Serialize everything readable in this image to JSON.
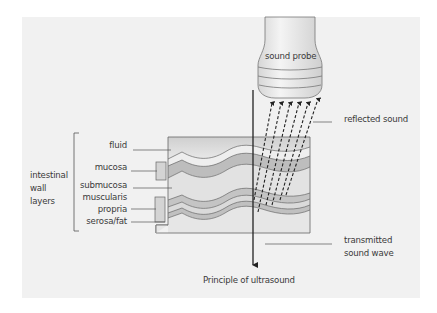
{
  "diagram": {
    "caption": "Principle of ultrasound",
    "probe_label": "sound probe",
    "group_label_lines": [
      "intestinal",
      "wall",
      "layers"
    ],
    "layers": [
      {
        "label": "fluid"
      },
      {
        "label": "mucosa"
      },
      {
        "label": "submucosa"
      },
      {
        "label": "muscularis"
      },
      {
        "label": "propria"
      },
      {
        "label": "serosa/fat"
      }
    ],
    "right_labels": {
      "reflected": "reflected sound",
      "transmitted_lines": [
        "transmitted",
        "sound wave"
      ]
    },
    "colors": {
      "panel_bg": "#f1f1f1",
      "tissue_light": "#e6e6e6",
      "tissue_mid": "#cfcfcf",
      "tissue_dark": "#b9b9b9",
      "line": "#555555",
      "arrow": "#222222",
      "text": "#3a3a3a"
    }
  }
}
